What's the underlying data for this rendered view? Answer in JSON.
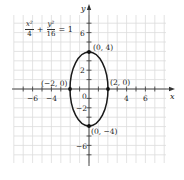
{
  "chart_data": {
    "type": "line",
    "title": "",
    "equation": {
      "term1_num": "x²",
      "term1_den": "4",
      "plus": "+",
      "term2_num": "y²",
      "term2_den": "16",
      "equals": "= 1",
      "text": "x^2/4 + y^2/16 = 1"
    },
    "xlabel": "x",
    "ylabel": "y",
    "xlim": [
      -8,
      8
    ],
    "ylim": [
      -8,
      8
    ],
    "grid": true,
    "x_tick_labels": [
      "−6",
      "−4",
      "4",
      "6"
    ],
    "x_tick_values": [
      -6,
      -4,
      4,
      6
    ],
    "y_tick_labels": [
      "6",
      "2",
      "−2",
      "−6"
    ],
    "y_tick_values": [
      6,
      2,
      -2,
      -6
    ],
    "origin_label": "0",
    "series": [
      {
        "name": "ellipse",
        "shape": "ellipse",
        "center": [
          0,
          0
        ],
        "semi_axis_x": 2,
        "semi_axis_y": 4,
        "color": "#1a1a1a"
      }
    ],
    "annotations": [
      {
        "label": "(0, 4)",
        "point": [
          0,
          4
        ]
      },
      {
        "label": "(−2, 0)",
        "point": [
          -2,
          0
        ]
      },
      {
        "label": "(2, 0)",
        "point": [
          2,
          0
        ]
      },
      {
        "label": "(0, −4)",
        "point": [
          0,
          -4
        ]
      }
    ]
  },
  "colors": {
    "grid": "#dcdcdc",
    "axis": "#333333",
    "curve": "#1a1a1a",
    "background": "#ffffff"
  }
}
